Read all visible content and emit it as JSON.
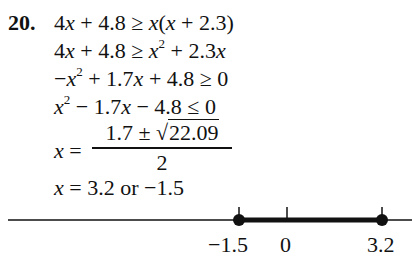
{
  "problem": {
    "number": "20.",
    "lines": [
      {
        "parts": [
          "4",
          "x",
          " + 4.8 ≥ ",
          "x",
          "(",
          "x",
          " + 2.3)"
        ]
      },
      {
        "parts": [
          "4",
          "x",
          " + 4.8 ≥ ",
          "x",
          "2",
          " + 2.3",
          "x"
        ]
      },
      {
        "parts": [
          "−",
          "x",
          "2",
          " + 1.7",
          "x",
          " + 4.8 ≥ 0"
        ]
      },
      {
        "parts": [
          "x",
          "2",
          " − 1.7",
          "x",
          " − 4.8 ≤ 0"
        ]
      }
    ],
    "quadratic": {
      "lhs_var": "x",
      "equals": " = ",
      "numerator_prefix": "1.7 ± √",
      "radicand": "22.09",
      "denominator": "2"
    },
    "solution": {
      "var": "x",
      "text": " = 3.2 or −1.5"
    }
  },
  "number_line": {
    "labels": [
      "−1.5",
      "0",
      "3.2"
    ],
    "interval": {
      "start": -1.5,
      "end": 3.2,
      "closed_start": true,
      "closed_end": true
    }
  }
}
